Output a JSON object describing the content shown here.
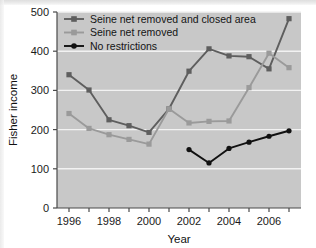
{
  "chart_data": {
    "type": "line",
    "title": "",
    "xlabel": "Year",
    "ylabel": "Fisher income",
    "xlim": [
      1995.4,
      2007.6
    ],
    "ylim": [
      0,
      500
    ],
    "yticks": [
      0,
      100,
      200,
      300,
      400,
      500
    ],
    "ytick_labels": [
      "0",
      "100",
      "200",
      "300",
      "400",
      "500"
    ],
    "xticks": [
      1996,
      1997,
      1998,
      1999,
      2000,
      2001,
      2002,
      2003,
      2004,
      2005,
      2006,
      2007
    ],
    "xtick_labels_shown": [
      "1996",
      "1998",
      "2000",
      "2002",
      "2004",
      "2006"
    ],
    "xtick_labels_shown_values": [
      1996,
      1998,
      2000,
      2002,
      2004,
      2006
    ],
    "grid": "horizontal-white",
    "legend_position": "top-left-inside",
    "plot_background": "#c8c8c8",
    "gridline_color": "#f2f2f2",
    "series": [
      {
        "name": "Seine net removed and closed area",
        "color": "#5e5e5e",
        "marker": "square",
        "x": [
          1996,
          1997,
          1998,
          1999,
          2000,
          2001,
          2002,
          2003,
          2004,
          2005,
          2006,
          2007
        ],
        "values": [
          340,
          301,
          225,
          210,
          193,
          253,
          349,
          406,
          388,
          386,
          355,
          483
        ]
      },
      {
        "name": "Seine net removed",
        "color": "#9a9a9a",
        "marker": "square",
        "x": [
          1996,
          1997,
          1998,
          1999,
          2000,
          2001,
          2002,
          2003,
          2004,
          2005,
          2006,
          2007
        ],
        "values": [
          241,
          203,
          187,
          175,
          163,
          253,
          217,
          221,
          222,
          307,
          395,
          358
        ]
      },
      {
        "name": "No restrictions",
        "color": "#111111",
        "marker": "circle",
        "x": [
          2002,
          2003,
          2004,
          2005,
          2006,
          2007
        ],
        "values": [
          149,
          115,
          152,
          168,
          183,
          197
        ]
      }
    ]
  },
  "axis": {
    "y_title": "Fisher income",
    "x_title": "Year"
  },
  "legend": {
    "items": [
      {
        "label": "Seine net removed and closed area",
        "color": "#5e5e5e",
        "marker": "square"
      },
      {
        "label": "Seine net removed",
        "color": "#9a9a9a",
        "marker": "square"
      },
      {
        "label": "No restrictions",
        "color": "#111111",
        "marker": "circle"
      }
    ]
  }
}
